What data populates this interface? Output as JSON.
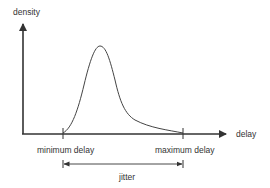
{
  "diagram": {
    "type": "probability-density-plot",
    "axes": {
      "y_label": "density",
      "x_label": "delay"
    },
    "markers": {
      "min_label": "minimum delay",
      "max_label": "maximum delay"
    },
    "span": {
      "label": "jitter"
    },
    "colors": {
      "stroke": "#333333",
      "background": "#ffffff"
    }
  }
}
